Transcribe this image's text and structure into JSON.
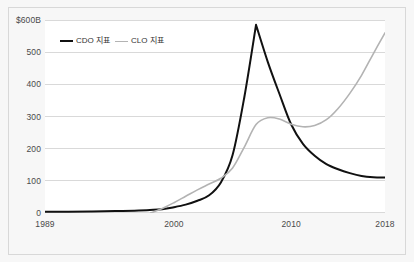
{
  "chart_data": {
    "type": "line",
    "title": "",
    "subtitle": "",
    "xlabel": "",
    "ylabel": "",
    "xlim": [
      1989,
      2018
    ],
    "ylim": [
      0,
      600
    ],
    "grid": true,
    "grid_axis": "y",
    "legend_position": "top-left-inside",
    "x_tick_labels": [
      "1989",
      "2000",
      "2010",
      "2018"
    ],
    "x_ticks": [
      1989,
      2000,
      2010,
      2018
    ],
    "y_tick_labels": [
      "$600B",
      "500",
      "400",
      "300",
      "200",
      "100",
      "0"
    ],
    "y_ticks": [
      600,
      500,
      400,
      300,
      200,
      100,
      0
    ],
    "series": [
      {
        "name": "CDO 지표",
        "color": "#111111",
        "x": [
          1989,
          1991,
          1993,
          1995,
          1997,
          1999,
          2000,
          2001,
          2002,
          2003,
          2004,
          2005,
          2006,
          2007,
          2008,
          2009,
          2010,
          2011,
          2012,
          2013,
          2014,
          2015,
          2016,
          2017,
          2018
        ],
        "values": [
          4,
          4,
          5,
          6,
          8,
          12,
          18,
          26,
          38,
          55,
          95,
          180,
          360,
          585,
          470,
          370,
          275,
          215,
          178,
          152,
          136,
          124,
          115,
          111,
          110
        ]
      },
      {
        "name": "CLO 지표",
        "color": "#b3b3b3",
        "x": [
          1998,
          1999,
          2000,
          2001,
          2002,
          2003,
          2004,
          2005,
          2006,
          2007,
          2008,
          2009,
          2010,
          2011,
          2012,
          2013,
          2014,
          2015,
          2016,
          2017,
          2018
        ],
        "values": [
          0,
          14,
          32,
          52,
          72,
          90,
          108,
          140,
          205,
          275,
          296,
          292,
          276,
          268,
          272,
          290,
          325,
          372,
          428,
          495,
          560
        ]
      }
    ]
  },
  "legend": {
    "entries": [
      {
        "label": "CDO 지표"
      },
      {
        "label": "CLO 지표"
      }
    ]
  },
  "colors": {
    "cdo_line": "#111111",
    "clo_line": "#b3b3b3",
    "gridline": "#d9d9d9",
    "axis_text": "#4a4a4a",
    "frame_border": "#d8d8d8",
    "figure_background": "#f7f7f7",
    "plot_background": "#ffffff"
  }
}
